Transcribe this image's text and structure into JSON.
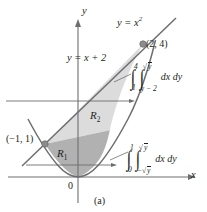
{
  "figure": {
    "caption": "(a)",
    "axes": {
      "x_label": "x",
      "y_label": "y",
      "origin_label": "0"
    },
    "curves": [
      {
        "name": "parabola",
        "label": "y = x",
        "label_exponent": "2",
        "equation": "y = x^2",
        "color": "#6d6e71"
      },
      {
        "name": "line",
        "label": "y = x + 2",
        "equation": "y = x + 2",
        "color": "#6d6e71"
      }
    ],
    "points": [
      {
        "name": "intersection-upper",
        "label": "(2, 4)",
        "x": 2,
        "y": 4
      },
      {
        "name": "intersection-lower",
        "label": "(−1, 1)",
        "x": -1,
        "y": 1
      }
    ],
    "regions": [
      {
        "name": "region-2",
        "label": "R",
        "label_subscript": "2",
        "fill": "#dcdcdc"
      },
      {
        "name": "region-1",
        "label": "R",
        "label_subscript": "1",
        "fill": "#b1b1b1"
      }
    ],
    "integrals": [
      {
        "name": "integral-upper",
        "outer_upper": "4",
        "outer_lower": "1",
        "inner_upper": "y",
        "inner_upper_radical": true,
        "inner_lower": "y − 2",
        "differential": "dx dy"
      },
      {
        "name": "integral-lower",
        "outer_upper": "1",
        "outer_lower": "0",
        "inner_upper": "y",
        "inner_upper_radical": true,
        "inner_lower": "− y",
        "inner_lower_radical": true,
        "differential": "dx dy"
      }
    ],
    "colors": {
      "stroke": "#6d6e71",
      "axis": "#6d6e71",
      "text": "#231f20",
      "region2_fill": "#dcdcdc",
      "region1_fill": "#b1b1b1",
      "point_fill": "#8c8c8c"
    }
  }
}
